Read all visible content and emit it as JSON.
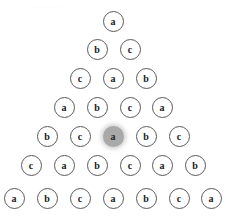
{
  "diagram": {
    "type": "triangular-node-arrangement",
    "row_count": 7,
    "node_diameter_px": 21,
    "colors": {
      "background": "#ffffff",
      "node_fill": "#ffffff",
      "node_stroke": "#5a5a5a",
      "node_label": "#1a1a1a",
      "highlight_fill": "#a9a9a9",
      "highlight_glow": "#a9a9a9"
    },
    "highlighted_node": {
      "row": 5,
      "index": 3,
      "label": "a",
      "center_x": 113,
      "center_y": 136
    },
    "rows": [
      {
        "row_index": 1,
        "center_y": 21,
        "nodes": [
          {
            "label": "a",
            "cx": 113,
            "highlighted": false
          }
        ]
      },
      {
        "row_index": 2,
        "center_y": 49,
        "nodes": [
          {
            "label": "b",
            "cx": 97,
            "highlighted": false
          },
          {
            "label": "c",
            "cx": 130,
            "highlighted": false
          }
        ]
      },
      {
        "row_index": 3,
        "center_y": 78,
        "nodes": [
          {
            "label": "c",
            "cx": 80,
            "highlighted": false
          },
          {
            "label": "a",
            "cx": 113,
            "highlighted": false
          },
          {
            "label": "b",
            "cx": 146,
            "highlighted": false
          }
        ]
      },
      {
        "row_index": 4,
        "center_y": 107,
        "nodes": [
          {
            "label": "a",
            "cx": 64,
            "highlighted": false
          },
          {
            "label": "b",
            "cx": 97,
            "highlighted": false
          },
          {
            "label": "c",
            "cx": 130,
            "highlighted": false
          },
          {
            "label": "a",
            "cx": 162,
            "highlighted": false
          }
        ]
      },
      {
        "row_index": 5,
        "center_y": 136,
        "nodes": [
          {
            "label": "b",
            "cx": 47,
            "highlighted": false
          },
          {
            "label": "c",
            "cx": 80,
            "highlighted": false
          },
          {
            "label": "a",
            "cx": 113,
            "highlighted": true
          },
          {
            "label": "b",
            "cx": 146,
            "highlighted": false
          },
          {
            "label": "c",
            "cx": 179,
            "highlighted": false
          }
        ]
      },
      {
        "row_index": 6,
        "center_y": 165,
        "nodes": [
          {
            "label": "c",
            "cx": 31,
            "highlighted": false
          },
          {
            "label": "a",
            "cx": 64,
            "highlighted": false
          },
          {
            "label": "b",
            "cx": 97,
            "highlighted": false
          },
          {
            "label": "c",
            "cx": 130,
            "highlighted": false
          },
          {
            "label": "a",
            "cx": 162,
            "highlighted": false
          },
          {
            "label": "b",
            "cx": 195,
            "highlighted": false
          }
        ]
      },
      {
        "row_index": 7,
        "center_y": 198,
        "nodes": [
          {
            "label": "a",
            "cx": 14,
            "highlighted": false
          },
          {
            "label": "b",
            "cx": 47,
            "highlighted": false
          },
          {
            "label": "c",
            "cx": 80,
            "highlighted": false
          },
          {
            "label": "a",
            "cx": 113,
            "highlighted": false
          },
          {
            "label": "b",
            "cx": 146,
            "highlighted": false
          },
          {
            "label": "c",
            "cx": 179,
            "highlighted": false
          },
          {
            "label": "a",
            "cx": 211,
            "highlighted": false
          }
        ]
      }
    ]
  }
}
